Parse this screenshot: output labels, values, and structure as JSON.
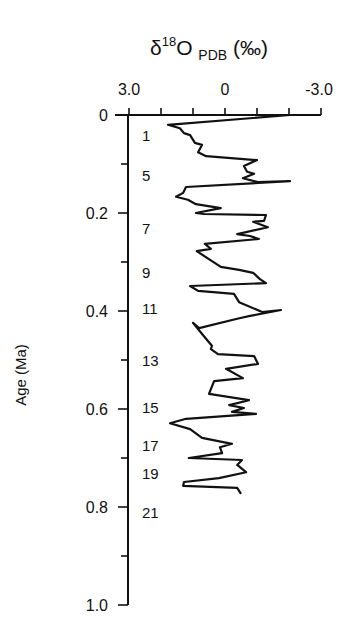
{
  "chart_data": {
    "type": "line",
    "title": "δ18O PDB (‰)",
    "title_parts": {
      "symbol": "δ",
      "sup": "18",
      "main": "O",
      "sub": "PDB",
      "unit": "(‰)"
    },
    "xlabel": "δ18O PDB (‰)",
    "ylabel": "Age (Ma)",
    "x_axis": {
      "position": "top",
      "range": [
        3.0,
        -3.0
      ],
      "reversed": true,
      "tick_labels": [
        "3.0",
        "0",
        "-3.0"
      ],
      "tick_values": [
        3.0,
        0,
        -3.0
      ],
      "minor_ticks": [
        3.0,
        2.0,
        1.0,
        0,
        -1.0,
        -2.0,
        -3.0
      ]
    },
    "y_axis": {
      "range": [
        0,
        1.0
      ],
      "inverted": true,
      "tick_labels": [
        "0",
        "0.2",
        "0.4",
        "0.6",
        "0.8",
        "1.0"
      ],
      "tick_values": [
        0,
        0.2,
        0.4,
        0.6,
        0.8,
        1.0
      ],
      "minor_ticks": [
        0.1,
        0.3,
        0.5,
        0.7,
        0.9
      ]
    },
    "grid": false,
    "legend": null,
    "annotations": [
      {
        "text": "1",
        "age": 0.041
      },
      {
        "text": "5",
        "age": 0.122
      },
      {
        "text": "7",
        "age": 0.231
      },
      {
        "text": "9",
        "age": 0.32
      },
      {
        "text": "11",
        "age": 0.394
      },
      {
        "text": "13",
        "age": 0.5
      },
      {
        "text": "15",
        "age": 0.596
      },
      {
        "text": "17",
        "age": 0.673
      },
      {
        "text": "19",
        "age": 0.731
      },
      {
        "text": "21",
        "age": 0.81
      }
    ],
    "series": [
      {
        "name": "δ18O",
        "color": "#111111",
        "points": [
          [
            -2.03,
            0.0
          ],
          [
            1.78,
            0.02
          ],
          [
            1.41,
            0.027
          ],
          [
            1.28,
            0.037
          ],
          [
            1.09,
            0.041
          ],
          [
            0.94,
            0.057
          ],
          [
            0.72,
            0.061
          ],
          [
            0.84,
            0.076
          ],
          [
            0.59,
            0.084
          ],
          [
            -1.0,
            0.092
          ],
          [
            -0.59,
            0.104
          ],
          [
            -0.69,
            0.116
          ],
          [
            -0.91,
            0.12
          ],
          [
            -0.56,
            0.129
          ],
          [
            -1.03,
            0.137
          ],
          [
            -2.03,
            0.135
          ],
          [
            1.22,
            0.147
          ],
          [
            1.31,
            0.159
          ],
          [
            1.53,
            0.167
          ],
          [
            1.16,
            0.173
          ],
          [
            0.91,
            0.182
          ],
          [
            0.13,
            0.19
          ],
          [
            0.91,
            0.2
          ],
          [
            0.66,
            0.202
          ],
          [
            -1.28,
            0.204
          ],
          [
            -1.22,
            0.216
          ],
          [
            -0.88,
            0.218
          ],
          [
            -1.34,
            0.229
          ],
          [
            -0.38,
            0.243
          ],
          [
            -0.78,
            0.247
          ],
          [
            -1.06,
            0.253
          ],
          [
            0.63,
            0.263
          ],
          [
            0.44,
            0.273
          ],
          [
            0.88,
            0.278
          ],
          [
            0.13,
            0.31
          ],
          [
            -0.44,
            0.316
          ],
          [
            -0.88,
            0.322
          ],
          [
            -1.09,
            0.335
          ],
          [
            -1.28,
            0.343
          ],
          [
            1.09,
            0.349
          ],
          [
            0.84,
            0.359
          ],
          [
            -0.28,
            0.365
          ],
          [
            -0.44,
            0.382
          ],
          [
            -1.16,
            0.402
          ],
          [
            -1.75,
            0.398
          ],
          [
            -0.78,
            0.41
          ],
          [
            -0.38,
            0.416
          ],
          [
            0.81,
            0.435
          ],
          [
            1.0,
            0.424
          ],
          [
            0.69,
            0.449
          ],
          [
            0.41,
            0.471
          ],
          [
            0.44,
            0.478
          ],
          [
            0.22,
            0.488
          ],
          [
            -0.91,
            0.492
          ],
          [
            -1.03,
            0.508
          ],
          [
            -0.03,
            0.518
          ],
          [
            -0.56,
            0.537
          ],
          [
            0.34,
            0.543
          ],
          [
            0.5,
            0.569
          ],
          [
            -0.75,
            0.582
          ],
          [
            -0.13,
            0.592
          ],
          [
            -0.59,
            0.598
          ],
          [
            -0.22,
            0.606
          ],
          [
            -0.97,
            0.61
          ],
          [
            1.22,
            0.62
          ],
          [
            1.72,
            0.629
          ],
          [
            1.09,
            0.641
          ],
          [
            0.72,
            0.659
          ],
          [
            -0.22,
            0.671
          ],
          [
            0.16,
            0.678
          ],
          [
            0.09,
            0.69
          ],
          [
            1.13,
            0.7
          ],
          [
            -0.53,
            0.704
          ],
          [
            -0.38,
            0.714
          ],
          [
            -0.66,
            0.729
          ],
          [
            0.19,
            0.741
          ],
          [
            1.28,
            0.749
          ],
          [
            1.31,
            0.757
          ],
          [
            -0.38,
            0.761
          ],
          [
            -0.5,
            0.773
          ]
        ]
      }
    ]
  }
}
